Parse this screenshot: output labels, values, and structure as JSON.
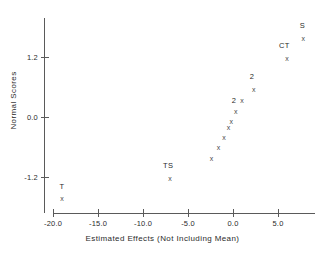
{
  "chart_data": {
    "type": "scatter",
    "title": "",
    "xlabel": "Estimated Effects (Not Including Mean)",
    "ylabel": "Normal Scores",
    "xlim": [
      -20.8,
      9.2
    ],
    "ylim": [
      -1.95,
      1.85
    ],
    "grid": false,
    "legend": null,
    "marker": "x",
    "xticks": [
      -20.0,
      -15.0,
      -10.0,
      -5.0,
      0.0,
      5.0
    ],
    "xtick_labels": [
      "-20.0",
      "-15.0",
      "-10.0",
      "-5.0",
      "0.0",
      "5.0"
    ],
    "yticks": [
      1.2,
      0.0,
      -1.2
    ],
    "ytick_labels": [
      "1.2",
      "0.0",
      "-1.2"
    ],
    "points": [
      {
        "x": -19.0,
        "y": -1.62,
        "label": "T"
      },
      {
        "x": -7.0,
        "y": -1.21,
        "label": "TS"
      },
      {
        "x": -2.4,
        "y": -0.82,
        "label": ""
      },
      {
        "x": -1.6,
        "y": -0.6,
        "label": ""
      },
      {
        "x": -1.0,
        "y": -0.39,
        "label": ""
      },
      {
        "x": -0.5,
        "y": -0.2,
        "label": ""
      },
      {
        "x": -0.2,
        "y": -0.08,
        "label": ""
      },
      {
        "x": 0.3,
        "y": 0.12,
        "label": "2"
      },
      {
        "x": 1.0,
        "y": 0.34,
        "label": ""
      },
      {
        "x": 2.3,
        "y": 0.56,
        "label": "2"
      },
      {
        "x": 6.0,
        "y": 1.18,
        "label": "CT"
      },
      {
        "x": 7.8,
        "y": 1.58,
        "label": "S"
      }
    ],
    "annotations": [
      {
        "text": "T",
        "x": -19.0,
        "y": -1.4
      },
      {
        "text": "TS",
        "x": -7.2,
        "y": -0.98
      },
      {
        "text": "2",
        "x": 0.1,
        "y": 0.33
      },
      {
        "text": "2",
        "x": 2.1,
        "y": 0.8
      },
      {
        "text": "CT",
        "x": 5.7,
        "y": 1.42
      },
      {
        "text": "S",
        "x": 7.7,
        "y": 1.82
      }
    ],
    "colors": {
      "background": "#ffffff",
      "axis": "#5a5a5a",
      "text": "#2b2b2b",
      "marker": "#4a4a4a"
    }
  }
}
